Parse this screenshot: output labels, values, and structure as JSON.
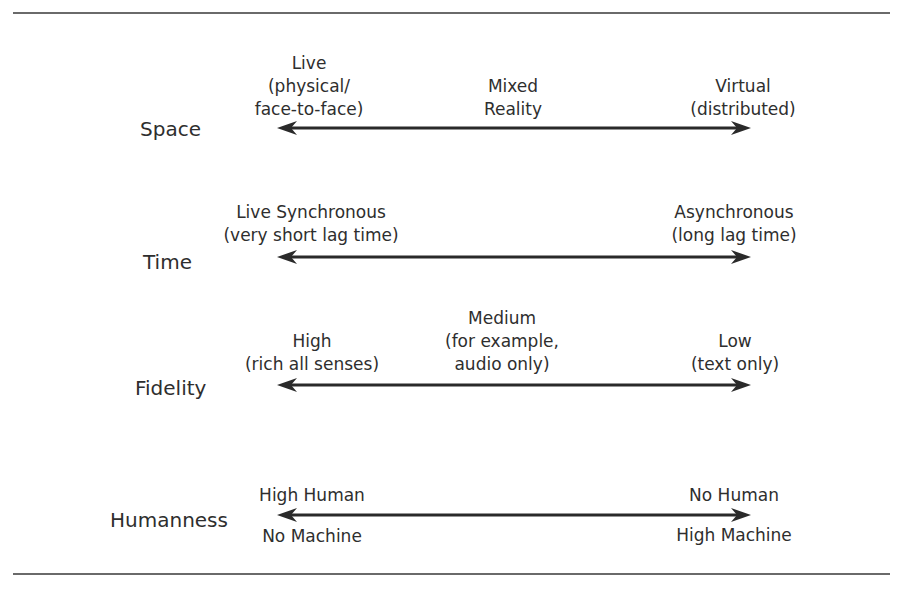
{
  "diagram": {
    "title": "",
    "colors": {
      "text": "#2e2e2e",
      "line": "#2a2a2a",
      "rule": "#6a6a6a"
    },
    "dimensions": [
      {
        "label": "Space",
        "left": {
          "lines": [
            "Live",
            "(physical/",
            "face-to-face)"
          ]
        },
        "middle": {
          "lines": [
            "Mixed",
            "Reality"
          ]
        },
        "right": {
          "lines": [
            "Virtual",
            "(distributed)"
          ]
        }
      },
      {
        "label": "Time",
        "left": {
          "lines": [
            "Live Synchronous",
            "(very short lag time)"
          ]
        },
        "right": {
          "lines": [
            "Asynchronous",
            "(long lag time)"
          ]
        }
      },
      {
        "label": "Fidelity",
        "left": {
          "lines": [
            "High",
            "(rich all senses)"
          ]
        },
        "middle": {
          "lines": [
            "Medium",
            "(for example,",
            "audio only)"
          ]
        },
        "right": {
          "lines": [
            "Low",
            "(text only)"
          ]
        }
      },
      {
        "label": "Humanness",
        "left_above": "High Human",
        "left_below": "No Machine",
        "right_above": "No Human",
        "right_below": "High Machine"
      }
    ]
  }
}
